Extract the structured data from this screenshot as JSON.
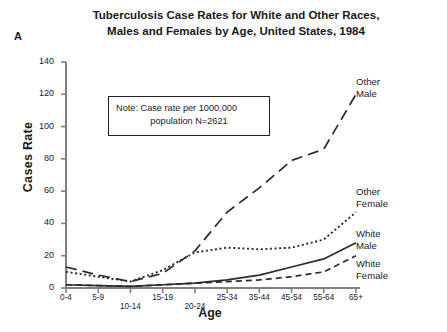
{
  "panel": {
    "label": "A"
  },
  "title": {
    "line1": "Tuberculosis Case Rates for White and Other Races,",
    "line2": "Males and Females by Age, United States, 1984"
  },
  "note": {
    "line1": "Note: Case rate per 1000,000",
    "line2": "population N=2621"
  },
  "axes": {
    "xlabel": "Age",
    "ylabel": "Cases Rate"
  },
  "series_labels": {
    "other_male": {
      "line1": "Other",
      "line2": "Male"
    },
    "other_female": {
      "line1": "Other",
      "line2": "Female"
    },
    "white_male": {
      "line1": "White",
      "line2": "Male"
    },
    "white_female": {
      "line1": "White",
      "line2": "Female"
    }
  },
  "chart_data": {
    "type": "line",
    "title": "Tuberculosis Case Rates for White and Other Races, Males and Females by Age, United States, 1984",
    "xlabel": "Age",
    "ylabel": "Cases Rate",
    "categories": [
      "0-4",
      "5-9",
      "10-14",
      "15-19",
      "20-24",
      "25-34",
      "35-44",
      "45-54",
      "55-64",
      "65+"
    ],
    "ytick_labels": [
      "0",
      "20",
      "40",
      "60",
      "80",
      "100",
      "120",
      "140"
    ],
    "yticks": [
      0,
      20,
      40,
      60,
      80,
      100,
      120,
      140
    ],
    "ylim": [
      0,
      140
    ],
    "grid": false,
    "legend": "inline-right-labels",
    "annotation": "Note: Case rate per 1000,000 population N=2621",
    "series": [
      {
        "name": "Other Male",
        "style": "long-dash",
        "values": [
          13,
          8,
          4,
          9,
          23,
          47,
          62,
          79,
          86,
          120
        ]
      },
      {
        "name": "Other Female",
        "style": "dotted",
        "values": [
          10,
          7,
          4,
          11,
          22,
          25,
          24,
          25,
          30,
          47
        ]
      },
      {
        "name": "White Male",
        "style": "solid",
        "values": [
          2,
          1.5,
          1,
          2,
          3,
          5,
          8,
          13,
          18,
          28
        ]
      },
      {
        "name": "White Female",
        "style": "short-dash",
        "values": [
          2,
          1.5,
          1,
          2,
          3,
          4,
          5,
          7,
          10,
          20
        ]
      }
    ]
  }
}
